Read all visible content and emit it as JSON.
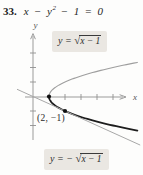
{
  "colors": {
    "background": "#fdfdfc",
    "axis": "#909090",
    "gray_curve": "#9e9e9e",
    "tangent_line": "#a8a8a8",
    "black_curve": "#1d1d1d",
    "label_box_bg": "#eae7e2",
    "text": "#1e1e1e"
  },
  "header": {
    "number": "33.",
    "eq_pre": "x − y",
    "eq_sup": "2",
    "eq_post": " − 1 = 0"
  },
  "labels": {
    "upper": {
      "lhs": "y = ",
      "radical": "√",
      "radicand": "x − 1"
    },
    "lower": {
      "lhs": "y = − ",
      "radical": "√",
      "radicand": "x − 1"
    },
    "point": "(2, −1)",
    "x_axis": "x",
    "y_axis": "y"
  },
  "chart_data": {
    "type": "line",
    "xlabel": "x",
    "ylabel": "y",
    "xlim": [
      -1,
      6.9
    ],
    "ylim": [
      -3.4,
      4.4
    ],
    "grid": false,
    "legend": "inline-labels",
    "axes": {
      "x_ticks": [
        2,
        3,
        4,
        5
      ],
      "y_ticks": [
        -2,
        -1,
        1,
        2,
        3
      ]
    },
    "series": [
      {
        "name": "y = √(x−1)",
        "role": "upper-branch",
        "equation": "y = sqrt(x−1)",
        "color": "#9e9e9e",
        "width": 1.1,
        "x": [
          1,
          2,
          3,
          4,
          5,
          6.5
        ],
        "y": [
          0,
          1,
          1.41,
          1.73,
          2,
          2.35
        ]
      },
      {
        "name": "y = −√(x−1)",
        "role": "lower-branch",
        "equation": "y = −sqrt(x−1)",
        "color": "#1d1d1d",
        "width": 1.8,
        "x": [
          1,
          2,
          3,
          4,
          5,
          6.5
        ],
        "y": [
          0,
          -1,
          -1.41,
          -1.73,
          -2,
          -2.35
        ]
      },
      {
        "name": "tangent at (2, −1)",
        "role": "tangent",
        "equation": "y = −x/2",
        "color": "#a8a8a8",
        "width": 1,
        "x": [
          -1,
          6.7
        ],
        "y": [
          0.5,
          -3.35
        ]
      }
    ],
    "marked_points": [
      {
        "x": 1,
        "y": 0
      },
      {
        "x": 2,
        "y": -1
      }
    ],
    "annotations": [
      {
        "text": "(2, −1)",
        "x": 2,
        "y": -1,
        "position": "below-left"
      }
    ]
  }
}
